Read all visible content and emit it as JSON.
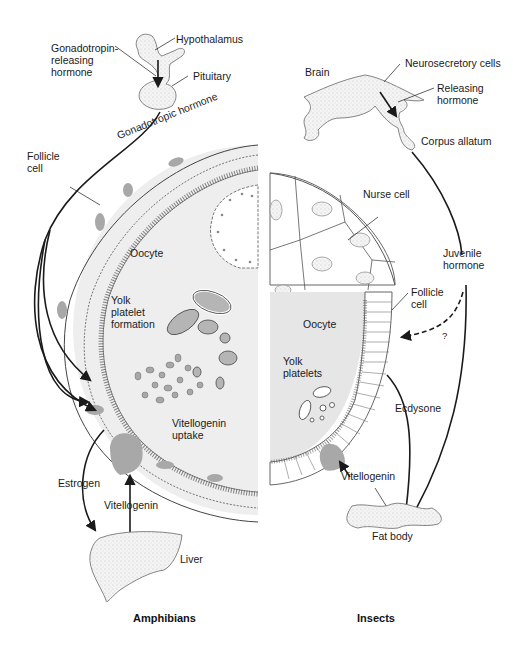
{
  "amphibians": {
    "caption": "Amphibians",
    "labels": {
      "hypothalamus": "Hypothalamus",
      "gnrh": "Gonadotropin-\nreleasing\nhormone",
      "pituitary": "Pituitary",
      "gonadotropic_hormone": "Gonadotropic hormone",
      "follicle_cell": "Follicle\ncell",
      "oocyte": "Oocyte",
      "yolk_platelet_formation": "Yolk\nplatelet\nformation",
      "vitellogenin_uptake": "Vitellogenin\nuptake",
      "estrogen": "Estrogen",
      "vitellogenin": "Vitellogenin",
      "liver": "Liver"
    }
  },
  "insects": {
    "caption": "Insects",
    "labels": {
      "brain": "Brain",
      "neurosecretory_cells": "Neurosecretory cells",
      "releasing_hormone": "Releasing\nhormone",
      "corpus_allatum": "Corpus allatum",
      "nurse_cell": "Nurse cell",
      "juvenile_hormone": "Juvenile\nhormone",
      "follicle_cell": "Follicle\ncell",
      "question": "?",
      "oocyte": "Oocyte",
      "yolk_platelets": "Yolk\nplatelets",
      "ecdysone": "Ecdysone",
      "vitellogenin": "Vitellogenin",
      "fat_body": "Fat body"
    }
  },
  "colors": {
    "line": "#1a1a1a",
    "oocyte_fill": "#e6e6e6",
    "dark_fill": "#a8a8a8",
    "organ_fill": "#f3f3f3"
  }
}
